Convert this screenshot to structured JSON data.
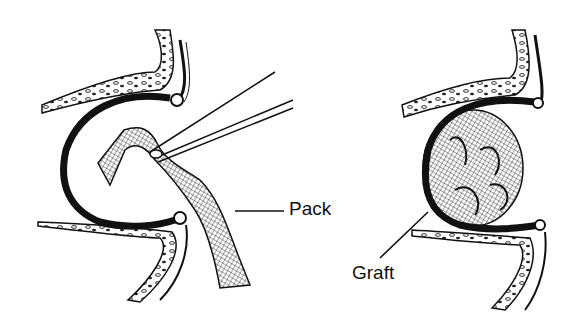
{
  "figure": {
    "panels": [
      {
        "id": "left",
        "description": "Cavity with pack being inserted by forceps",
        "label": "Pack"
      },
      {
        "id": "right",
        "description": "Cavity filled with graft",
        "label": "Graft"
      }
    ]
  },
  "labels": {
    "pack": "Pack",
    "graft": "Graft"
  },
  "colors": {
    "ink": "#111111",
    "background": "#ffffff"
  }
}
